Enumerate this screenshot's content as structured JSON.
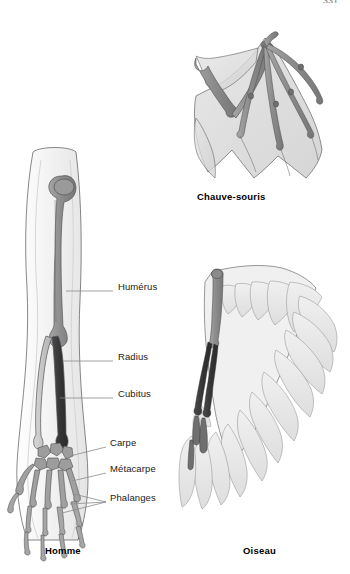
{
  "figure": {
    "folio": "331",
    "background_color": "#ffffff"
  },
  "palette": {
    "bone_light": "#c9c9c9",
    "bone_mid": "#8f8f8f",
    "bone_dark": "#3a3a3a",
    "flesh_light": "#f2f2f2",
    "membrane": "#dcdcdc",
    "feather": "#e8e8e8",
    "outline": "#55555a",
    "leader_line": "#8c8c8c",
    "label_text": "#1a1a1a",
    "caption_text": "#000000"
  },
  "labels": [
    {
      "id": "humerus",
      "text": "Humérus",
      "x": 120,
      "y": 287,
      "leader_from_x": 113,
      "leader_from_y": 291,
      "leader_to_x": 66,
      "leader_to_y": 291
    },
    {
      "id": "radius",
      "text": "Radius",
      "x": 120,
      "y": 357,
      "leader_from_x": 113,
      "leader_from_y": 361,
      "leader_to_x": 63,
      "leader_to_y": 361
    },
    {
      "id": "cubitus",
      "text": "Cubitus",
      "x": 120,
      "y": 394,
      "leader_from_x": 113,
      "leader_from_y": 398,
      "leader_to_x": 60,
      "leader_to_y": 398
    },
    {
      "id": "carpe",
      "text": "Carpe",
      "x": 112,
      "y": 443,
      "leader_from_x": 106,
      "leader_from_y": 447,
      "leader_to_x": 70,
      "leader_to_y": 455
    },
    {
      "id": "metacarpe",
      "text": "Métacarpe",
      "x": 112,
      "y": 469,
      "leader_from_x": 106,
      "leader_from_y": 473,
      "leader_to_x": 72,
      "leader_to_y": 480
    },
    {
      "id": "phalanges",
      "text": "Phalanges",
      "x": 112,
      "y": 498,
      "leader_from_x": 106,
      "leader_from_y": 502,
      "leader_to_x": 60,
      "leader_to_y": 497
    }
  ],
  "specimens": [
    {
      "id": "homme",
      "caption": "Homme",
      "caption_x": 45,
      "caption_y": 552
    },
    {
      "id": "chauve-souris",
      "caption": "Chauve-souris",
      "caption_x": 197,
      "caption_y": 198
    },
    {
      "id": "oiseau",
      "caption": "Oiseau",
      "caption_x": 243,
      "caption_y": 552
    }
  ],
  "bone_parts": [
    {
      "specimen": "homme",
      "name": "humerus"
    },
    {
      "specimen": "homme",
      "name": "radius"
    },
    {
      "specimen": "homme",
      "name": "cubitus"
    },
    {
      "specimen": "homme",
      "name": "carpe"
    },
    {
      "specimen": "homme",
      "name": "metacarpe"
    },
    {
      "specimen": "homme",
      "name": "phalanges"
    },
    {
      "specimen": "chauve-souris",
      "name": "humerus"
    },
    {
      "specimen": "chauve-souris",
      "name": "avant-bras"
    },
    {
      "specimen": "chauve-souris",
      "name": "doigts"
    },
    {
      "specimen": "chauve-souris",
      "name": "membrane-alaire"
    },
    {
      "specimen": "oiseau",
      "name": "humerus"
    },
    {
      "specimen": "oiseau",
      "name": "avant-bras"
    },
    {
      "specimen": "oiseau",
      "name": "main"
    },
    {
      "specimen": "oiseau",
      "name": "plumes"
    }
  ]
}
